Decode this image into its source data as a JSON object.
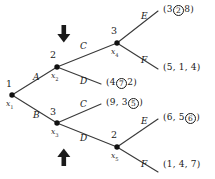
{
  "figure": {
    "type": "extensive-form-game-tree",
    "colors": {
      "line": "#3a3a3a",
      "node": "#111111",
      "text": "#1a1a1a",
      "background": "#ffffff"
    }
  },
  "nodes": [
    {
      "id": "x1",
      "name": "x",
      "sub": "1",
      "player": "1",
      "x": 12,
      "y": 95
    },
    {
      "id": "x2",
      "name": "x",
      "sub": "2",
      "player": "2",
      "x": 57,
      "y": 67
    },
    {
      "id": "x3",
      "name": "x",
      "sub": "3",
      "player": "3",
      "x": 57,
      "y": 123
    },
    {
      "id": "x4",
      "name": "x",
      "sub": "4",
      "player": "3",
      "x": 117,
      "y": 43
    },
    {
      "id": "x5",
      "name": "x",
      "sub": "5",
      "player": "2",
      "x": 117,
      "y": 147
    }
  ],
  "edges": [
    {
      "from": "x1",
      "to": "x2",
      "label": "A",
      "lx": 31,
      "ly": 78
    },
    {
      "from": "x1",
      "to": "x3",
      "label": "B",
      "lx": 31,
      "ly": 115
    },
    {
      "from": "x2",
      "to": "x4",
      "label": "C",
      "lx": 82,
      "ly": 47
    },
    {
      "from": "x2",
      "to": "t3",
      "label": "D",
      "lx": 82,
      "ly": 82
    },
    {
      "from": "x3",
      "to": "t4",
      "label": "C",
      "lx": 82,
      "ly": 105
    },
    {
      "from": "x3",
      "to": "x5",
      "label": "D",
      "lx": 82,
      "ly": 139
    },
    {
      "from": "x4",
      "to": "t1",
      "label": "E",
      "lx": 143,
      "ly": 16
    },
    {
      "from": "x4",
      "to": "t2",
      "label": "F",
      "lx": 143,
      "ly": 61
    },
    {
      "from": "x5",
      "to": "t5",
      "label": "E",
      "lx": 143,
      "ly": 121
    },
    {
      "from": "x5",
      "to": "t6",
      "label": "F",
      "lx": 143,
      "ly": 166
    }
  ],
  "terminals": [
    {
      "id": "t1",
      "values": [
        "3",
        "2",
        "8"
      ],
      "circled_index": 1,
      "x": 163,
      "y": 7,
      "ex": 159,
      "ey": 10
    },
    {
      "id": "t2",
      "values": [
        "5",
        "1",
        "4"
      ],
      "circled_index": -1,
      "x": 163,
      "y": 65,
      "ex": 159,
      "ey": 68
    },
    {
      "id": "t3",
      "values": [
        "4",
        "7",
        "2"
      ],
      "circled_index": 1,
      "x": 106,
      "y": 80,
      "ex": 102,
      "ey": 83
    },
    {
      "id": "t4",
      "values": [
        "9",
        "3",
        "5"
      ],
      "circled_index": 2,
      "x": 106,
      "y": 100,
      "ex": 102,
      "ey": 103
    },
    {
      "id": "t5",
      "values": [
        "6",
        "5",
        "6"
      ],
      "circled_index": 2,
      "x": 163,
      "y": 115,
      "ex": 159,
      "ey": 118
    },
    {
      "id": "t6",
      "values": [
        "1",
        "4",
        "7"
      ],
      "circled_index": -1,
      "x": 163,
      "y": 162,
      "ex": 159,
      "ey": 165
    }
  ],
  "arrows": [
    {
      "id": "arrow-down-x2",
      "direction": "down",
      "x": 64,
      "y": 26,
      "meaning": "down-arrow"
    },
    {
      "id": "arrow-up-x3",
      "direction": "up",
      "x": 64,
      "y": 142,
      "meaning": "up-arrow"
    }
  ]
}
